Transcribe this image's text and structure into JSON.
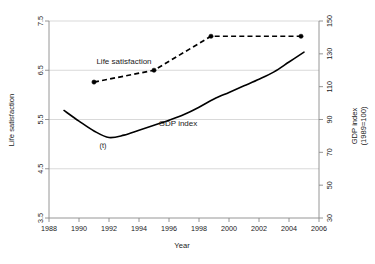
{
  "chart_data": {
    "type": "line",
    "title": "",
    "xlabel": "Year",
    "ylabel": "Life satisfaction",
    "y2label": "GDP index (1989=100)",
    "y2label_line1": "GDP index",
    "y2label_line2": "(1989=100)",
    "xlim": [
      1988,
      2006
    ],
    "ylim": [
      3.5,
      7.5
    ],
    "y2lim": [
      30,
      150
    ],
    "xticks": [
      1988,
      1990,
      1992,
      1994,
      1996,
      1998,
      2000,
      2002,
      2004,
      2006
    ],
    "yticks": [
      3.5,
      4.5,
      5.5,
      6.5,
      7.5
    ],
    "y2ticks": [
      30,
      50,
      70,
      90,
      110,
      130,
      150
    ],
    "grid": "horizontal",
    "legend_position": "inline-annotations",
    "annotations": [
      {
        "text": "Life satisfaction",
        "x": 1993.0,
        "y": 6.62,
        "name": "life-satisfaction-label"
      },
      {
        "text": "GDP index",
        "x": 1996.6,
        "y": 5.36,
        "name": "gdp-index-label"
      },
      {
        "text": "(t)",
        "x": 1991.6,
        "y": 4.92,
        "name": "trough-marker-label"
      }
    ],
    "series": [
      {
        "name": "Life satisfaction",
        "axis": "left",
        "style": "dashed",
        "markers": true,
        "color": "#000000",
        "x": [
          1991.0,
          1995.0,
          1998.8,
          2004.8
        ],
        "values": [
          6.26,
          6.5,
          7.19,
          7.19
        ]
      },
      {
        "name": "GDP index",
        "axis": "right",
        "style": "solid",
        "markers": false,
        "color": "#000000",
        "x": [
          1989.0,
          1990.0,
          1991.0,
          1992.0,
          1993.0,
          1994.0,
          1995.0,
          1996.0,
          1997.0,
          1998.0,
          1999.0,
          2000.0,
          2001.0,
          2002.0,
          2003.0,
          2004.0,
          2005.0
        ],
        "values": [
          95.5,
          89.0,
          83.0,
          79.0,
          80.5,
          83.5,
          86.5,
          89.5,
          93.0,
          97.5,
          102.5,
          106.5,
          110.5,
          114.5,
          119.0,
          125.0,
          131.0
        ]
      }
    ]
  }
}
